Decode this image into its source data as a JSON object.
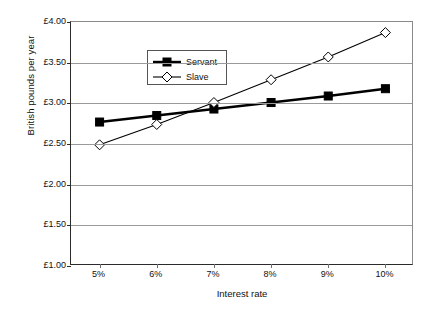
{
  "chart_data": {
    "type": "line",
    "title": "",
    "xlabel": "Interest rate",
    "ylabel": "British pounds per year",
    "categories": [
      "5%",
      "6%",
      "7%",
      "8%",
      "9%",
      "10%"
    ],
    "x_tick_labels": [
      "5%",
      "6%",
      "7%",
      "8%",
      "9%",
      "10%"
    ],
    "y_tick_labels": [
      "£4.00",
      "£3.50",
      "£3.00",
      "£2.50",
      "£2.00",
      "£1.50",
      "£1.00"
    ],
    "y_tick_values": [
      4.0,
      3.5,
      3.0,
      2.5,
      2.0,
      1.5,
      1.0
    ],
    "ylim": [
      1.0,
      4.0
    ],
    "grid": true,
    "legend_position": "upper-left-inside",
    "series": [
      {
        "name": "Servant",
        "marker": "filled-square",
        "color": "#000000",
        "values": [
          2.77,
          2.85,
          2.93,
          3.01,
          3.09,
          3.18
        ]
      },
      {
        "name": "Slave",
        "marker": "open-diamond",
        "color": "#000000",
        "values": [
          2.49,
          2.74,
          3.01,
          3.29,
          3.57,
          3.87
        ]
      }
    ]
  },
  "legend": {
    "items": [
      {
        "label": "Servant",
        "marker": "filled-square"
      },
      {
        "label": "Slave",
        "marker": "open-diamond"
      }
    ]
  },
  "colors": {
    "line": "#000000",
    "grid": "#9a9a9a",
    "axis": "#2b2b2b",
    "background": "#ffffff"
  }
}
